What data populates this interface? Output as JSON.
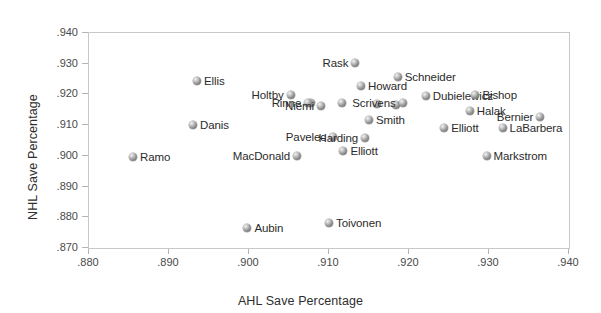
{
  "chart_data": {
    "type": "scatter",
    "title": "",
    "xlabel": "AHL Save Percentage",
    "ylabel": "NHL Save Percentage",
    "xlim": [
      0.88,
      0.94
    ],
    "ylim": [
      0.87,
      0.94
    ],
    "xticks": [
      ".880",
      ".890",
      ".900",
      ".910",
      ".920",
      ".930",
      ".940"
    ],
    "yticks": [
      ".870",
      ".880",
      ".890",
      ".900",
      ".910",
      ".920",
      ".930",
      ".940"
    ],
    "grid": false,
    "legend": "none",
    "marker_color": "#8a8a8a",
    "frame_color": "#c8c8c8",
    "points": [
      {
        "label": "Ramo",
        "x": 0.8855,
        "y": 0.8995,
        "side": "right"
      },
      {
        "label": "Ellis",
        "x": 0.8935,
        "y": 0.9245,
        "side": "right"
      },
      {
        "label": "Danis",
        "x": 0.893,
        "y": 0.9101,
        "side": "right"
      },
      {
        "label": "Aubin",
        "x": 0.8998,
        "y": 0.8765,
        "side": "right"
      },
      {
        "label": "Toivonen",
        "x": 0.91,
        "y": 0.878,
        "side": "right"
      },
      {
        "label": "Holtby",
        "x": 0.9052,
        "y": 0.9199,
        "side": "left"
      },
      {
        "label": "Rinne",
        "x": 0.9074,
        "y": 0.9172,
        "side": "left"
      },
      {
        "label": "Niemi",
        "x": 0.909,
        "y": 0.9163,
        "side": "left"
      },
      {
        "label": "MacDonald",
        "x": 0.906,
        "y": 0.8998,
        "side": "left"
      },
      {
        "label": "Pavelec",
        "x": 0.9105,
        "y": 0.906,
        "side": "left"
      },
      {
        "label": "Rask",
        "x": 0.9133,
        "y": 0.9302,
        "side": "left"
      },
      {
        "label": "Howard",
        "x": 0.914,
        "y": 0.9228,
        "side": "right"
      },
      {
        "label": "Schneider",
        "x": 0.9186,
        "y": 0.9258,
        "side": "right"
      },
      {
        "label": "Harding",
        "x": 0.9145,
        "y": 0.9058,
        "side": "left"
      },
      {
        "label": "Smith",
        "x": 0.915,
        "y": 0.9116,
        "side": "right"
      },
      {
        "label": "Elliott",
        "x": 0.9118,
        "y": 0.9015,
        "side": "right"
      },
      {
        "label": "Scrivens",
        "x": 0.9192,
        "y": 0.9172,
        "side": "left"
      },
      {
        "label": "Dubielewicz",
        "x": 0.9221,
        "y": 0.9196,
        "side": "right"
      },
      {
        "label": "Bishop",
        "x": 0.9283,
        "y": 0.9198,
        "side": "right"
      },
      {
        "label": "Halak",
        "x": 0.9276,
        "y": 0.9145,
        "side": "right"
      },
      {
        "label": "Elliott",
        "x": 0.9244,
        "y": 0.909,
        "side": "right"
      },
      {
        "label": "LaBarbera",
        "x": 0.9317,
        "y": 0.909,
        "side": "right"
      },
      {
        "label": "Bernier",
        "x": 0.9364,
        "y": 0.9128,
        "side": "left"
      },
      {
        "label": "Markstrom",
        "x": 0.9297,
        "y": 0.9,
        "side": "right"
      }
    ],
    "extra_markers": [
      {
        "x": 0.916,
        "y": 0.9168
      },
      {
        "x": 0.9184,
        "y": 0.9167
      },
      {
        "x": 0.9078,
        "y": 0.9172
      },
      {
        "x": 0.9116,
        "y": 0.9172
      }
    ]
  }
}
